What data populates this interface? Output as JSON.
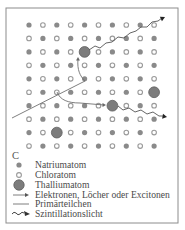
{
  "figure": {
    "panel_label": "C",
    "frame": {
      "x": 6,
      "y": 8,
      "w": 172,
      "h": 215,
      "stroke": "#8c8c8c"
    },
    "colors": {
      "sodium_fill": "#8a8a8a",
      "chlorine_stroke": "#9a9a9a",
      "thallium_fill": "#7c7c7c",
      "thallium_stroke": "#5e5e5e",
      "line": "#707070"
    },
    "lattice": {
      "rows": 10,
      "cols": 10,
      "x0": 29,
      "dx": 13.9,
      "y0": 25,
      "dy": 13.45,
      "pattern": "checkerboard: (row+col) even = Natriumatom, odd = Chloratom",
      "thallium_sites": [
        {
          "row": 2,
          "col": 4
        },
        {
          "row": 5,
          "col": 9
        },
        {
          "row": 6,
          "col": 6
        },
        {
          "row": 8,
          "col": 2
        }
      ]
    },
    "primary_particle": {
      "from": [
        12,
        118
      ],
      "to": [
        85,
        81
      ]
    },
    "carrier_arrows": [
      {
        "d": "M85,81 C80,76 77,70 78,59",
        "head": [
          78,
          57
        ],
        "angle": -90
      },
      {
        "d": "M57,92 C60,100 68,103 80,103 L104,105",
        "head": [
          106,
          105
        ],
        "angle": 0
      }
    ],
    "scintillation": [
      {
        "points": [
          [
            89,
            50
          ],
          [
            95,
            46
          ],
          [
            100,
            48
          ],
          [
            106,
            43
          ],
          [
            112,
            42
          ],
          [
            118,
            37
          ],
          [
            124,
            38
          ],
          [
            130,
            33
          ],
          [
            136,
            31
          ],
          [
            141,
            27
          ],
          [
            147,
            27
          ],
          [
            152,
            22
          ],
          [
            158,
            21
          ],
          [
            162,
            18
          ]
        ],
        "head": [
          165,
          17
        ],
        "angle": -25
      },
      {
        "points": [
          [
            118,
            106
          ],
          [
            123,
            110
          ],
          [
            129,
            108
          ],
          [
            135,
            112
          ],
          [
            141,
            110
          ],
          [
            147,
            114
          ],
          [
            153,
            112
          ],
          [
            159,
            116
          ],
          [
            163,
            116
          ]
        ],
        "head": [
          167,
          117
        ],
        "angle": 10
      }
    ]
  },
  "legend": {
    "items": [
      {
        "icon": "sodium-dot-icon",
        "label": "Natriumatom",
        "y": 168
      },
      {
        "icon": "chlorine-ring-icon",
        "label": "Chloratom",
        "y": 178
      },
      {
        "icon": "thallium-disc-icon",
        "label": "Thalliumatom",
        "y": 188
      },
      {
        "icon": "arrow-icon",
        "label": "Elektronen, Löcher oder Excitonen",
        "y": 198
      },
      {
        "icon": "line-icon",
        "label": "Primärteilchen",
        "y": 207
      },
      {
        "icon": "wavy-arrow-icon",
        "label": "Szintillationslicht",
        "y": 217
      }
    ]
  }
}
